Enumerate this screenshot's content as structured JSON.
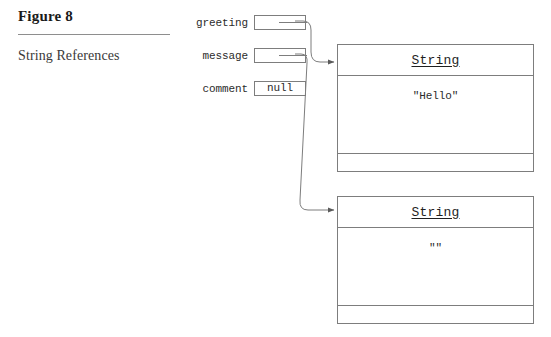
{
  "figure": {
    "number": "Figure 8",
    "caption": "String References"
  },
  "variables": [
    {
      "name": "greeting",
      "value": "",
      "kind": "reference"
    },
    {
      "name": "message",
      "value": "",
      "kind": "reference"
    },
    {
      "name": "comment",
      "value": "null",
      "kind": "null"
    }
  ],
  "objects": [
    {
      "type": "String",
      "value": "\"Hello\""
    },
    {
      "type": "String",
      "value": "\"\""
    }
  ],
  "colors": {
    "stroke": "#7d7d7d",
    "text": "#2b2b2b",
    "rule": "#8e8e8e",
    "background": "#ffffff"
  }
}
